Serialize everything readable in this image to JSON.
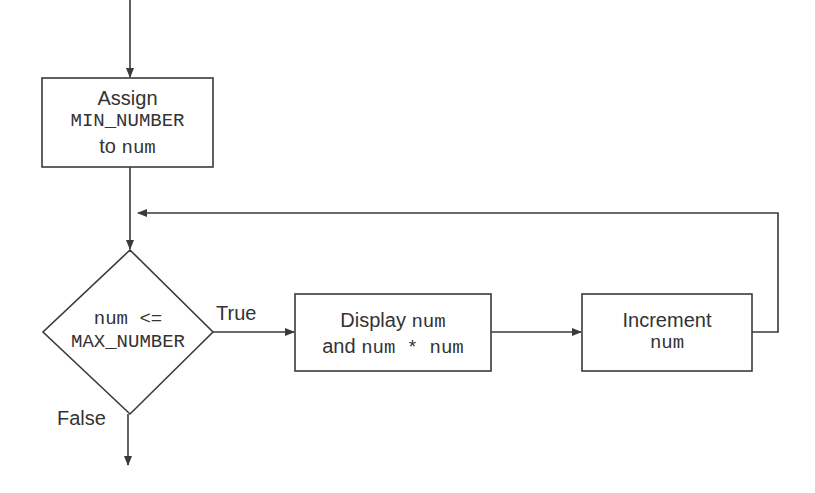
{
  "diagram": {
    "type": "flowchart",
    "nodes": {
      "assign": {
        "line1": "Assign",
        "line2_code": "MIN_NUMBER",
        "line3_text": "to",
        "line3_code": "num"
      },
      "condition": {
        "line1_code": "num <=",
        "line2_code": "MAX_NUMBER"
      },
      "display": {
        "line1_text": "Display",
        "line1_code": "num",
        "line2_text": "and",
        "line2_code": "num * num"
      },
      "increment": {
        "line1": "Increment",
        "line2_code": "num"
      }
    },
    "edges": {
      "true_label": "True",
      "false_label": "False"
    },
    "colors": {
      "stroke": "#3a3a3a",
      "background": "#ffffff"
    }
  }
}
